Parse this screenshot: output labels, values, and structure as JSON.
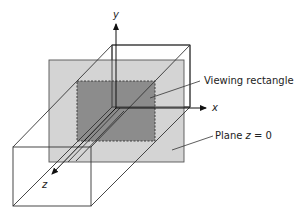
{
  "diagram": {
    "title": "",
    "labels": {
      "axis_y": "y",
      "axis_x": "x",
      "axis_z": "z",
      "viewing_rectangle": "Viewing rectangle",
      "plane": "Plane z = 0",
      "plane_prefix": "Plane ",
      "plane_var": "z",
      "plane_suffix": " = 0"
    },
    "colors": {
      "background": "#ffffff",
      "plane_fill": "#d4d4d4",
      "viewing_rect_fill": "#8c8c8c",
      "lines": "#222222"
    }
  }
}
